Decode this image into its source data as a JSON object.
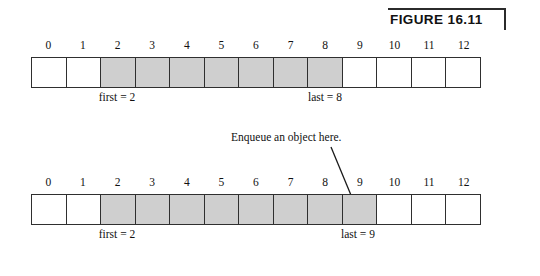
{
  "figure": {
    "label": "FIGURE 16.11",
    "annotation": "Enqueue an object here.",
    "colors": {
      "filled_cell": "#cfcfcf",
      "empty_cell": "#ffffff",
      "border": "#2f2f2f",
      "text": "#111111"
    }
  },
  "arrays": [
    {
      "id": "before-enqueue",
      "indices": [
        "0",
        "1",
        "2",
        "3",
        "4",
        "5",
        "6",
        "7",
        "8",
        "9",
        "10",
        "11",
        "12"
      ],
      "filled": [
        false,
        false,
        true,
        true,
        true,
        true,
        true,
        true,
        true,
        false,
        false,
        false,
        false
      ],
      "first_label": "first = 2",
      "last_label": "last = 8",
      "first_index": 2,
      "last_index": 8
    },
    {
      "id": "after-enqueue",
      "indices": [
        "0",
        "1",
        "2",
        "3",
        "4",
        "5",
        "6",
        "7",
        "8",
        "9",
        "10",
        "11",
        "12"
      ],
      "filled": [
        false,
        false,
        true,
        true,
        true,
        true,
        true,
        true,
        true,
        true,
        false,
        false,
        false
      ],
      "first_label": "first = 2",
      "last_label": "last = 9",
      "first_index": 2,
      "last_index": 9
    }
  ]
}
